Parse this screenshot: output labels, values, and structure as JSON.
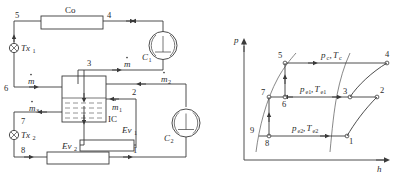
{
  "figure": {
    "domain": "thermodynamic-schematic",
    "panels": [
      "two-stage refrigeration cycle schematic",
      "pressure-enthalpy diagram"
    ]
  },
  "schematic": {
    "components": {
      "condenser": "Co",
      "compressor_high": "C",
      "compressor_high_sub": "1",
      "compressor_low": "C",
      "compressor_low_sub": "2",
      "expansion_valve_1": "Tx",
      "expansion_valve_1_sub": "1",
      "expansion_valve_2": "Tx",
      "expansion_valve_2_sub": "2",
      "intercooler": "IC",
      "evaporator_1": "Ev",
      "evaporator_1_sub": "1",
      "evaporator_2": "Ev",
      "evaporator_2_sub": "2"
    },
    "state_points": [
      "1",
      "2",
      "3",
      "4",
      "5",
      "6",
      "7",
      "8"
    ],
    "mass_flows": {
      "total": "m",
      "total_sub": "",
      "stream_1": "m",
      "stream_1_sub": "1",
      "stream_2": "m",
      "stream_2_sub": "2",
      "stream_3": "m",
      "stream_3_sub": "3"
    }
  },
  "ph_diagram": {
    "y_axis_label": "p",
    "x_axis_label": "h",
    "process_labels": [
      {
        "id": "condensing",
        "p": "p",
        "p_sub": "c",
        "t": "T",
        "t_sub": "c"
      },
      {
        "id": "intermediate",
        "p": "p",
        "p_sub": "e1",
        "t": "T",
        "t_sub": "e1"
      },
      {
        "id": "low-stage",
        "p": "p",
        "p_sub": "e2",
        "t": "T",
        "t_sub": "e2"
      }
    ],
    "state_points": [
      "1",
      "2",
      "3",
      "4",
      "5",
      "6",
      "7",
      "8",
      "9"
    ]
  },
  "colors": {
    "line": "#3a3a3a",
    "dome": "#6a6a6a",
    "text": "#2b2b2b",
    "background": "#ffffff"
  }
}
